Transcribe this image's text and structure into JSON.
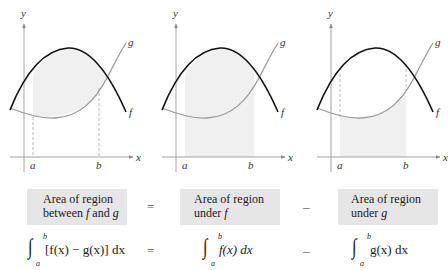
{
  "colors": {
    "f_curve": "#111111",
    "g_curve": "#9a9a9a",
    "shade": "#f0f0f0",
    "box_bg": "#e6e6e6",
    "axis": "#8a8a8a"
  },
  "graphs": [
    {
      "id": "between",
      "shaded_region": "between f and g from a to b",
      "labels": {
        "y": "y",
        "x": "x",
        "f": "f",
        "g": "g",
        "a": "a",
        "b": "b"
      }
    },
    {
      "id": "under_f",
      "shaded_region": "under f from a to b",
      "labels": {
        "y": "y",
        "x": "x",
        "f": "f",
        "g": "g",
        "a": "a",
        "b": "b"
      }
    },
    {
      "id": "under_g",
      "shaded_region": "under g from a to b",
      "labels": {
        "y": "y",
        "x": "x",
        "f": "f",
        "g": "g",
        "a": "a",
        "b": "b"
      }
    }
  ],
  "equation": {
    "boxes": [
      {
        "line1": "Area of  region",
        "line2_prefix": "between ",
        "line2_f": "f",
        "line2_mid": " and ",
        "line2_g": "g"
      },
      {
        "line1": "Area of  region",
        "line2_prefix": "under ",
        "line2_var": "f"
      },
      {
        "line1": "Area of  region",
        "line2_prefix": "under ",
        "line2_var": "g"
      }
    ],
    "operators": [
      "=",
      "–"
    ],
    "integrals": [
      {
        "upper": "b",
        "lower": "a",
        "body": "[f(x) − g(x)] dx"
      },
      {
        "upper": "b",
        "lower": "a",
        "body": "f(x) dx"
      },
      {
        "upper": "b",
        "lower": "a",
        "body": "g(x) dx"
      }
    ],
    "integral_operators": [
      "=",
      "–"
    ],
    "integral_sign": "∫"
  }
}
